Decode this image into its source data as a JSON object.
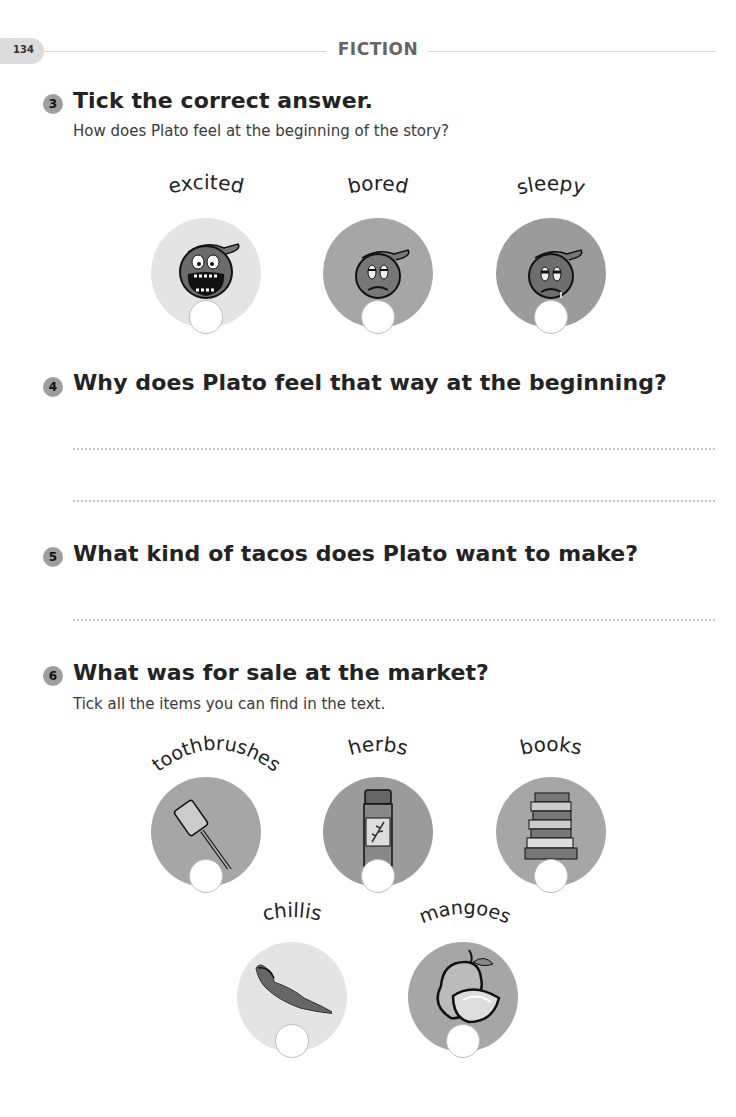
{
  "header": {
    "page_number": "134",
    "section_title": "FICTION"
  },
  "questions": [
    {
      "number": "3",
      "title": "Tick the correct answer.",
      "subtitle": "How does Plato feel at the beginning of the story?",
      "options": [
        {
          "label": "excited",
          "icon": "excited-face-icon",
          "shade": "#e4e4e4"
        },
        {
          "label": "bored",
          "icon": "bored-face-icon",
          "shade": "#a6a6a6"
        },
        {
          "label": "sleepy",
          "icon": "sleepy-face-icon",
          "shade": "#9b9b9b"
        }
      ]
    },
    {
      "number": "4",
      "title": "Why does Plato feel that way at the beginning?",
      "answer_lines": 2
    },
    {
      "number": "5",
      "title": "What kind of tacos does Plato want to make?",
      "answer_lines": 1
    },
    {
      "number": "6",
      "title": "What was for sale at the market?",
      "subtitle": "Tick all the items you can find in the text.",
      "options": [
        {
          "label": "toothbrushes",
          "icon": "toothbrush-icon",
          "shade": "#a6a6a6"
        },
        {
          "label": "herbs",
          "icon": "herb-jar-icon",
          "shade": "#9b9b9b"
        },
        {
          "label": "books",
          "icon": "books-stack-icon",
          "shade": "#a6a6a6"
        },
        {
          "label": "chillis",
          "icon": "chilli-icon",
          "shade": "#e4e4e4"
        },
        {
          "label": "mangoes",
          "icon": "mango-icon",
          "shade": "#a6a6a6"
        }
      ]
    }
  ]
}
